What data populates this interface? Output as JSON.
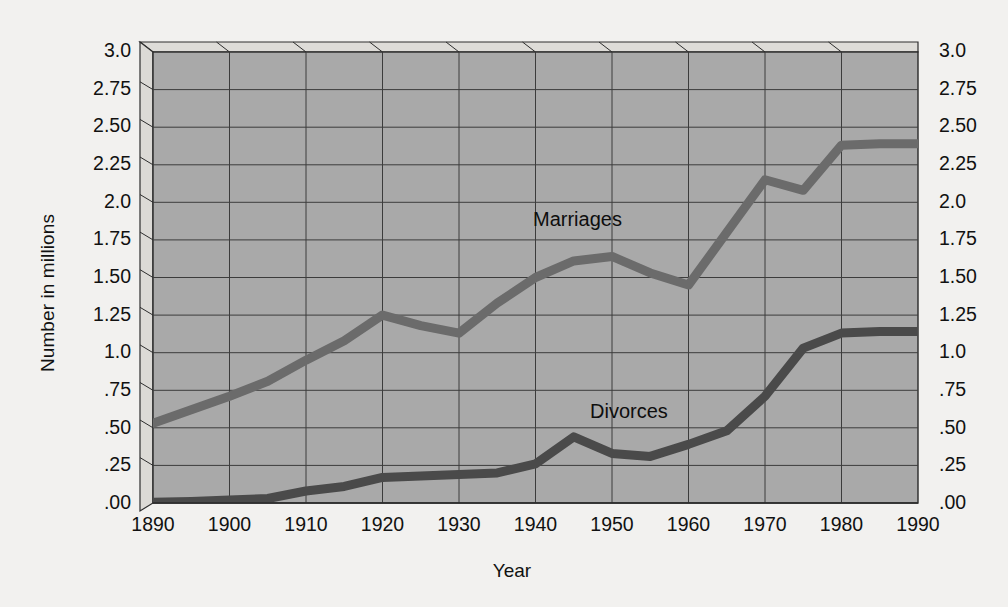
{
  "chart_data": {
    "type": "line",
    "title": "",
    "xlabel": "Year",
    "ylabel": "Number in millions",
    "xlim": [
      1890,
      1990
    ],
    "ylim": [
      0.0,
      3.0
    ],
    "grid": true,
    "legend_position": "inline-annotation",
    "style": "3d-walled-plot-area",
    "x_tick_labels": [
      "1890",
      "1900",
      "1910",
      "1920",
      "1930",
      "1940",
      "1950",
      "1960",
      "1970",
      "1980",
      "1990"
    ],
    "y_tick_labels": [
      "3.0",
      "2.75",
      "2.50",
      "2.25",
      "2.0",
      "1.75",
      "1.50",
      "1.25",
      "1.0",
      ".75",
      ".50",
      ".25",
      ".00"
    ],
    "y_tick_values": [
      3.0,
      2.75,
      2.5,
      2.25,
      2.0,
      1.75,
      1.5,
      1.25,
      1.0,
      0.75,
      0.5,
      0.25,
      0.0
    ],
    "x": [
      1890,
      1895,
      1900,
      1905,
      1910,
      1915,
      1920,
      1925,
      1930,
      1935,
      1940,
      1945,
      1950,
      1955,
      1960,
      1965,
      1970,
      1975,
      1980,
      1985,
      1990
    ],
    "series": [
      {
        "name": "Marriages",
        "color": "#6b6b6b",
        "values": [
          0.53,
          0.62,
          0.71,
          0.81,
          0.95,
          1.08,
          1.25,
          1.18,
          1.13,
          1.33,
          1.5,
          1.61,
          1.64,
          1.53,
          1.45,
          1.8,
          2.15,
          2.08,
          2.38,
          2.39,
          2.39
        ]
      },
      {
        "name": "Divorces",
        "color": "#4a4a4a",
        "values": [
          0.005,
          0.01,
          0.02,
          0.03,
          0.08,
          0.11,
          0.17,
          0.18,
          0.19,
          0.2,
          0.26,
          0.44,
          0.33,
          0.31,
          0.39,
          0.48,
          0.71,
          1.03,
          1.13,
          1.14,
          1.14
        ]
      }
    ],
    "annotations": [
      {
        "text": "Marriages",
        "x": 1950,
        "y": 1.85
      },
      {
        "text": "Divorces",
        "x": 1963,
        "y": 0.57
      }
    ]
  },
  "axes": {
    "y_title": "Number in millions",
    "x_title": "Year"
  },
  "colors": {
    "page_background": "#f2f1ef",
    "plot_background": "#a8a8a8",
    "wall_light": "#d8d7d4",
    "grid": "#3b3b3b",
    "marriages": "#6b6b6b",
    "divorces": "#4a4a4a",
    "text": "#111111"
  }
}
